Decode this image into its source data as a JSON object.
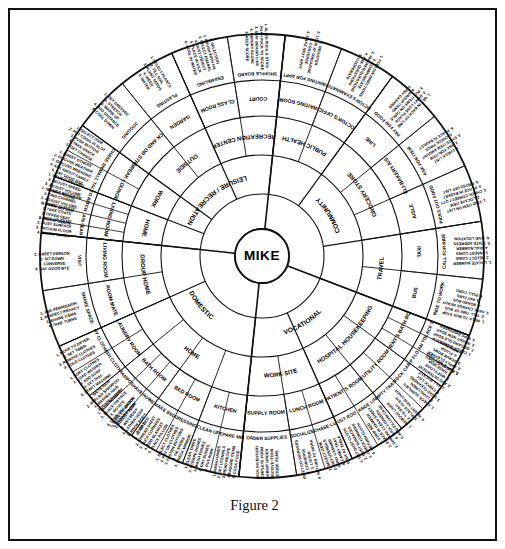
{
  "figure": {
    "caption": "Figure 2",
    "hub_label": "MIKE",
    "type": "radial-curriculum-wheel",
    "ring_count": 5
  },
  "colors": {
    "ink": "#111111",
    "paper": "#ffffff",
    "rule": "#111111"
  },
  "geometry": {
    "center_x": 238,
    "center_y": 232,
    "hub_radius": 27,
    "ring_radii": [
      27,
      62,
      101,
      140,
      176,
      222
    ],
    "font_sizes": [
      6.6,
      5.9,
      5.2,
      4.6,
      3.9
    ]
  },
  "rings": {
    "ring1_label": "Domain",
    "ring2_label": "Setting",
    "ring3_label": "Sub-setting",
    "ring4_label": "Activity",
    "ring5_label": "Task steps"
  },
  "chart_data": {
    "type": "radial-hierarchy",
    "title": "Figure 2",
    "center": "MIKE",
    "domains": [
      {
        "name": "DOMESTIC",
        "start_deg": 186,
        "end_deg": 294,
        "settings": [
          {
            "name": "HOME",
            "span_deg": 108,
            "subsettings": [
              {
                "name": "KITCHEN",
                "activities": [
                  {
                    "name": "PREPARE MEAL",
                    "steps": [
                      "1. WASH HANDS",
                      "2. GET UTENSILS",
                      "3. READ RECIPE",
                      "4. MEASURE ITEMS",
                      "5. COOK FOOD"
                    ]
                  },
                  {
                    "name": "CLEAN UP",
                    "steps": [
                      "1. CLEAR TABLE",
                      "2. SCRAPE DISHES",
                      "3. WASH DISHES",
                      "4. DRY DISHES",
                      "5. PUT AWAY"
                    ]
                  }
                ]
              },
              {
                "name": "BED ROOM",
                "activities": [
                  {
                    "name": "DRESSING",
                    "steps": [
                      "1. SELECT CLOTHES",
                      "2. PUT ON CLOTHES",
                      "3. FASTEN BUTTONS",
                      "4. TIE SHOES",
                      "5. CHECK MIRROR"
                    ]
                  },
                  {
                    "name": "MAKE BED",
                    "steps": [
                      "1. STRIP BED",
                      "2. SPREAD SHEET",
                      "3. TUCK CORNERS",
                      "4. ADD BLANKET",
                      "5. PLACE PILLOW"
                    ]
                  }
                ]
              },
              {
                "name": "BATH ROOM",
                "activities": [
                  {
                    "name": "SHOWER",
                    "steps": [
                      "1. TURN ON WATER",
                      "2. ADJUST TEMP",
                      "3. WET BODY",
                      "4. LATHER SOAP",
                      "5. RINSE BODY",
                      "6. DRY"
                    ]
                  },
                  {
                    "name": "SHAVE",
                    "steps": [
                      "1. PLUG IN RAZOR",
                      "2. PLACE ON FACE",
                      "3. ROTATE",
                      "4. TURN OFF RAZOR",
                      "5. CLEAN RAZOR"
                    ]
                  },
                  {
                    "name": "SHAMPOO",
                    "steps": [
                      "1. WETS HAIR",
                      "2. APPLIES SHAMPOO",
                      "3. WASHES HAIR",
                      "4. RINSES HAIR"
                    ]
                  }
                ]
              },
              {
                "name": "LAUNDRY ROOM",
                "activities": [
                  {
                    "name": "WASH CLOTHES",
                    "steps": [
                      "1. SORT CLOTHES",
                      "2. LOAD WASHER",
                      "3. ADD SOAP",
                      "4. SET DIAL",
                      "5. START MACHINE"
                    ]
                  },
                  {
                    "name": "DRY CLOTHES",
                    "steps": [
                      "1. MOVE TO DRYER",
                      "2. SET TIMER",
                      "3. REMOVE CLOTHES",
                      "4. FOLD CLOTHES"
                    ]
                  }
                ]
              }
            ]
          },
          {
            "name": "GROUP HOME",
            "span_deg": 36,
            "subsettings": [
              {
                "name": "ROOM MATE",
                "activities": [
                  {
                    "name": "SHARE SPACE",
                    "steps": [
                      "1. ASK PERMISSION",
                      "2. RESPECT PRIVACY",
                      "3. SHARE ITEMS",
                      "4. TAKE TURNS"
                    ]
                  }
                ]
              },
              {
                "name": "LIVING ROOM",
                "activities": [
                  {
                    "name": "VISIT",
                    "steps": [
                      "1. GREET PERSON",
                      "2. SIT DOWN",
                      "3. CONVERSE",
                      "4. SAY GOOD BYE"
                    ]
                  }
                ]
              }
            ]
          }
        ]
      },
      {
        "name": "LEISURE / RECREATION",
        "start_deg": 294,
        "end_deg": 360,
        "settings": [
          {
            "name": "HOME",
            "subsettings": [
              {
                "name": "LIVING ROOM",
                "activities": [
                  {
                    "name": "CLEAN UP",
                    "steps": [
                      "1. PICK UP ITEMS",
                      "2. DUST SURFACE",
                      "3. VACUUM FLOOR",
                      "4. EMPTY TRASH"
                    ]
                  },
                  {
                    "name": "ENTERTAIN GUESTS",
                    "steps": [
                      "1. GREET GUESTS",
                      "2. TAKE COATS",
                      "3. OFFER SEAT",
                      "4. SERVE SNACK"
                    ]
                  },
                  {
                    "name": "WATCH T.V.",
                    "steps": [
                      "1. SELECT PROGRAM",
                      "2. FIND CHANNEL",
                      "3. ADJUST VOLUME",
                      "4. TURN SET OFF"
                    ]
                  },
                  {
                    "name": "LISTEN TO RECORDS",
                    "steps": [
                      "1. SELECT RECORD",
                      "2. ADJUST SPEED",
                      "3. ADJUST VOLUME",
                      "4. SING ALONG"
                    ]
                  }
                ]
              }
            ]
          },
          {
            "name": "WORK",
            "subsettings": [
              {
                "name": "BREAK LOUNGE",
                "activities": [
                  {
                    "name": "SMALL TALK",
                    "steps": [
                      "1. GREET OTHERS",
                      "2. DISCUSS WEATHER",
                      "3. DISCUSS WEEKEND",
                      "4. ASK ABOUT FAMILY",
                      "5. SAY GOOD BYE"
                    ]
                  },
                  {
                    "name": "PURCHASE SNACK",
                    "steps": [
                      "1. SELECT ITEM",
                      "2. PUT COINS IN SLOT",
                      "3. PUSH BUTTON",
                      "4. TAKE SNACK",
                      "5. GET CHANGE"
                    ]
                  }
                ]
              }
            ]
          },
          {
            "name": "OUTSIDE",
            "subsettings": [
              {
                "name": "TRACK AND OR STREET",
                "activities": [
                  {
                    "name": "JOGGING",
                    "steps": [
                      "1. GET DRESSED",
                      "2. STRETCH",
                      "3. WARM UP",
                      "4. JOG DISTANCE",
                      "5. COOL DOWN"
                    ]
                  }
                ]
              },
              {
                "name": "GARDEN",
                "activities": [
                  {
                    "name": "PLANTING",
                    "steps": [
                      "1. SELECT PLANTS",
                      "2. TILL SOIL",
                      "3. PLANT SEEDS",
                      "4. WEED",
                      "5. WATER"
                    ]
                  }
                ]
              }
            ]
          },
          {
            "name": "RECREATION CENTER",
            "subsettings": [
              {
                "name": "CLASS ROOM",
                "activities": [
                  {
                    "name": "ENAMELING",
                    "steps": [
                      "1. SELECTION",
                      "2. BRUSH WITH OIL",
                      "3. SELECT ENAMEL",
                      "4. DUST OBJECT",
                      "5. PLACE IN KILN",
                      "6. COOL IN WATER"
                    ]
                  }
                ]
              },
              {
                "name": "COURT",
                "activities": [
                  {
                    "name": "SHUFFLE BOARD",
                    "steps": [
                      "1. ALIGN PUCK & STICK",
                      "2. PUSH PUCK TO SCORE",
                      "3. STAY BEHIND LINE",
                      "4. REPORT SCORE",
                      "5. KEEP SCORE"
                    ]
                  }
                ]
              }
            ]
          }
        ]
      },
      {
        "name": "COMMUNITY",
        "start_deg": 0,
        "end_deg": 78,
        "settings": [
          {
            "name": "PUBLIC HEALTH",
            "subsettings": [
              {
                "name": "WAITING ROOM",
                "activities": [
                  {
                    "name": "WAITING FOR APPT",
                    "steps": [
                      "1. REGISTER",
                      "2. LOOK AT MAGAZINE",
                      "3. CONVERSE",
                      "4. MAKE NEXT APPT"
                    ]
                  }
                ]
              },
              {
                "name": "DOCTOR'S OFFICE",
                "activities": [
                  {
                    "name": "DOCTOR'S EXAMINATION",
                    "steps": [
                      "1. FOLLOW DIRECTIONS",
                      "2. COMMUNICATE",
                      "3. ANSWER QUESTIONS",
                      "4. ASK QUESTIONS",
                      "5. COOPERATE"
                    ]
                  }
                ]
              }
            ]
          },
          {
            "name": "GROCERY STORE",
            "subsettings": [
              {
                "name": "LINE",
                "activities": [
                  {
                    "name": "PAY FOR FOOD",
                    "steps": [
                      "1. GET IN BACK OF LINE",
                      "2. DON'T LOSE PLACE",
                      "3. PUT ITEMS ON TABLE",
                      "4. GROUP ITEMS",
                      "5. PAY CASHIER"
                    ]
                  }
                ]
              },
              {
                "name": "DELI-BAKERY AISLE",
                "activities": [
                  {
                    "name": "ASK FOR ITEM",
                    "steps": [
                      "1. CHECK LIST",
                      "2. ASK FOR ITEM",
                      "3. STATE ITEM AMOUNT",
                      "4. CHECK PRICE",
                      "5. PLACE IN BASKET"
                    ]
                  }
                ]
              },
              {
                "name": "AISLE",
                "activities": [
                  {
                    "name": "PICKS OUT FOOD",
                    "steps": [
                      "1. FIND ITEM ON LIST",
                      "2. LOCATE ITEM",
                      "3. CHECK CORRECT QTY",
                      "4. PLACE IN BASKET",
                      "5. CROSS OFF LIST"
                    ]
                  }
                ]
              }
            ]
          },
          {
            "name": "TRAVEL",
            "subsettings": [
              {
                "name": "TAXI",
                "activities": [
                  {
                    "name": "CALL FOR RIDE",
                    "steps": [
                      "1. LOCATE NUMBER",
                      "2. SELECT COINS",
                      "3. INSERT COINS",
                      "4. DIAL NUMBER",
                      "5. STATE ADDRESS",
                      "6. GIVE LOCATION"
                    ]
                  }
                ]
              },
              {
                "name": "BUS",
                "activities": [
                  {
                    "name": "RIDE TO WORK",
                    "steps": [
                      "1. WALK TO BUS STOP",
                      "2. TELL TIME OF BUS",
                      "3. HAVE CHANGE READY",
                      "4. BOARD BUS",
                      "5. PAY FARE",
                      "6. PULL CORD"
                    ]
                  }
                ]
              }
            ]
          }
        ]
      },
      {
        "name": "VOCATIONAL",
        "start_deg": 78,
        "end_deg": 186,
        "settings": [
          {
            "name": "HOSPITAL HOUSEKEEPING",
            "subsettings": [
              {
                "name": "PATIENT'S BATH ROOM",
                "activities": [
                  {
                    "name": "REPLACE SOAP",
                    "steps": [
                      "1. CHECK DISPENSER",
                      "2. DISCARD OLD SOAP",
                      "3. INSERT NEW SOAP",
                      "4. WIPE DISPENSER"
                    ]
                  },
                  {
                    "name": "CLEAN TOILET",
                    "steps": [
                      "1. PUT ON GLOVES",
                      "2. APPLY CLEANER",
                      "3. SCRUB BOWL",
                      "4. FLUSH",
                      "5. WIPE SEAT"
                    ]
                  },
                  {
                    "name": "MOP FLOOR",
                    "steps": [
                      "1. FILL BUCKET",
                      "2. ADD DETERGENT",
                      "3. MOP FLOOR",
                      "4. RINSE MOP",
                      "5. PLACE WET SIGN"
                    ]
                  }
                ]
              },
              {
                "name": "UTILITY ROOM",
                "activities": [
                  {
                    "name": "STOCK CART",
                    "steps": [
                      "1. CHECK SUPPLIES",
                      "2. LOAD LINEN",
                      "3. LOAD CLEANERS",
                      "4. CHECK LIST"
                    ]
                  },
                  {
                    "name": "EMPTY TRASH",
                    "steps": [
                      "1. REMOVE LINER",
                      "2. TIE BAG",
                      "3. PLACE IN BIN",
                      "4. INSERT NEW LINER"
                    ]
                  }
                ]
              },
              {
                "name": "PATIENT'S ROOM",
                "activities": [
                  {
                    "name": "CHANGE LINEN",
                    "steps": [
                      "1. STRIP BED",
                      "2. PLACE IN HAMPER",
                      "3. SPREAD CLEAN SHEET",
                      "4. TUCK CORNERS",
                      "5. ADD PILLOW CASE"
                    ]
                  },
                  {
                    "name": "DUST ROOM",
                    "steps": [
                      "1. GET DUST CLOTH",
                      "2. DUST SURFACES",
                      "3. CHECK CORNERS",
                      "4. RETURN CLOTH"
                    ]
                  }
                ]
              }
            ]
          },
          {
            "name": "WORK SITE",
            "subsettings": [
              {
                "name": "LUNCH ROOM",
                "activities": [
                  {
                    "name": "PURCHASE LUNCH",
                    "steps": [
                      "1. SELECT ITEM",
                      "2. GET UTENSILS",
                      "3. PAY CASHIER",
                      "4. CARRY TRAY",
                      "5. SIT AT TABLE"
                    ]
                  },
                  {
                    "name": "SOCIALIZE",
                    "steps": [
                      "1. GREET CO-WORKERS",
                      "2. CONVERSE",
                      "3. LISTEN",
                      "4. RETURN TO WORK"
                    ]
                  }
                ]
              },
              {
                "name": "SUPPLY ROOM",
                "activities": [
                  {
                    "name": "ORDER SUPPLIES",
                    "steps": [
                      "1. CHECK INVENTORY",
                      "2. COMPLETE FORM",
                      "3. SUBMIT ORDER",
                      "4. RECEIVE ITEMS",
                      "5. STORE ITEMS"
                    ]
                  }
                ]
              }
            ]
          }
        ]
      }
    ]
  }
}
